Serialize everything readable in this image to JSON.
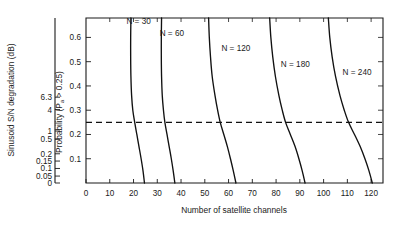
{
  "chart_data": {
    "type": "line",
    "title": "",
    "xlabel": "Number of satellite channels",
    "ylabel_left": "Sinusoid S/N degradation (dB)",
    "ylabel_inner": "Probability (P",
    "ylabel_inner_sub": "a",
    "ylabel_inner_tail": " > 0.25)",
    "xlim": [
      0,
      125
    ],
    "xticks": [
      0,
      10,
      20,
      30,
      40,
      50,
      60,
      70,
      80,
      90,
      100,
      110,
      120
    ],
    "xtick_labels": [
      "0",
      "10",
      "20",
      "30",
      "40",
      "50",
      "60",
      "70",
      "80",
      "90",
      "100",
      "110",
      "120"
    ],
    "ylim": [
      0,
      0.68
    ],
    "yticks_inner": [
      0.1,
      0.2,
      0.3,
      0.4,
      0.5,
      0.6
    ],
    "ytick_labels_inner": [
      "0.1",
      "0.2",
      "0.3",
      "0.4",
      "0.5",
      "0.6"
    ],
    "ytick_values_left": [
      0,
      0.05,
      0.1,
      0.15,
      0.2,
      0.5,
      1,
      4,
      6.3
    ],
    "ytick_labels_left": [
      "0",
      "0.05",
      "0.1",
      "0.15",
      "0.2",
      "0.5",
      "1",
      "4",
      "6.3"
    ],
    "ytick_positions_left": [
      0.0,
      0.042,
      0.088,
      0.133,
      0.177,
      0.265,
      0.315,
      0.445,
      0.52
    ],
    "grid": false,
    "legend": "inline-labels",
    "threshold_line": {
      "value": 0.25,
      "style": "dashed",
      "label": "P = 0.25"
    },
    "series": [
      {
        "name": "N = 30",
        "label": "N = 30",
        "label_x": 17,
        "label_y": 0.655,
        "x_at_threshold": 20.5,
        "x_at_zero": 24.5,
        "points": [
          [
            18.9,
            0.68
          ],
          [
            18.8,
            0.6
          ],
          [
            18.8,
            0.52
          ],
          [
            18.9,
            0.44
          ],
          [
            19.2,
            0.36
          ],
          [
            19.7,
            0.3
          ],
          [
            20.5,
            0.25
          ],
          [
            21.4,
            0.2
          ],
          [
            22.3,
            0.15
          ],
          [
            23.2,
            0.1
          ],
          [
            24.0,
            0.05
          ],
          [
            24.6,
            0.0
          ]
        ]
      },
      {
        "name": "N = 60",
        "label": "N = 60",
        "label_x": 31,
        "label_y": 0.605,
        "x_at_threshold": 33.2,
        "x_at_zero": 37.3,
        "points": [
          [
            31.8,
            0.68
          ],
          [
            31.7,
            0.6
          ],
          [
            31.7,
            0.52
          ],
          [
            31.8,
            0.44
          ],
          [
            32.1,
            0.36
          ],
          [
            32.6,
            0.3
          ],
          [
            33.2,
            0.25
          ],
          [
            34.1,
            0.2
          ],
          [
            35.0,
            0.15
          ],
          [
            35.9,
            0.1
          ],
          [
            36.7,
            0.05
          ],
          [
            37.4,
            0.0
          ]
        ]
      },
      {
        "name": "N = 120",
        "label": "N = 120",
        "label_x": 57,
        "label_y": 0.545,
        "x_at_threshold": 56.5,
        "x_at_zero": 63.0,
        "points": [
          [
            51.6,
            0.68
          ],
          [
            51.9,
            0.6
          ],
          [
            52.4,
            0.52
          ],
          [
            53.1,
            0.44
          ],
          [
            54.3,
            0.36
          ],
          [
            55.4,
            0.3
          ],
          [
            56.5,
            0.25
          ],
          [
            58.0,
            0.2
          ],
          [
            59.5,
            0.15
          ],
          [
            60.8,
            0.1
          ],
          [
            62.0,
            0.05
          ],
          [
            63.1,
            0.0
          ]
        ]
      },
      {
        "name": "N = 180",
        "label": "N = 180",
        "label_x": 82,
        "label_y": 0.48,
        "x_at_threshold": 84.0,
        "x_at_zero": 92.0,
        "points": [
          [
            77.3,
            0.68
          ],
          [
            77.8,
            0.6
          ],
          [
            78.6,
            0.52
          ],
          [
            79.7,
            0.44
          ],
          [
            81.2,
            0.36
          ],
          [
            82.6,
            0.3
          ],
          [
            84.0,
            0.25
          ],
          [
            86.0,
            0.2
          ],
          [
            88.0,
            0.15
          ],
          [
            89.6,
            0.1
          ],
          [
            91.0,
            0.05
          ],
          [
            92.2,
            0.0
          ]
        ]
      },
      {
        "name": "N = 240",
        "label": "N = 240",
        "label_x": 108,
        "label_y": 0.445,
        "x_at_threshold": 110.5,
        "x_at_zero": 120.3,
        "points": [
          [
            102.0,
            0.68
          ],
          [
            102.6,
            0.6
          ],
          [
            103.6,
            0.52
          ],
          [
            105.0,
            0.44
          ],
          [
            106.9,
            0.36
          ],
          [
            108.7,
            0.3
          ],
          [
            110.5,
            0.25
          ],
          [
            113.0,
            0.2
          ],
          [
            115.4,
            0.15
          ],
          [
            117.4,
            0.1
          ],
          [
            119.1,
            0.05
          ],
          [
            120.5,
            0.0
          ]
        ]
      }
    ]
  }
}
